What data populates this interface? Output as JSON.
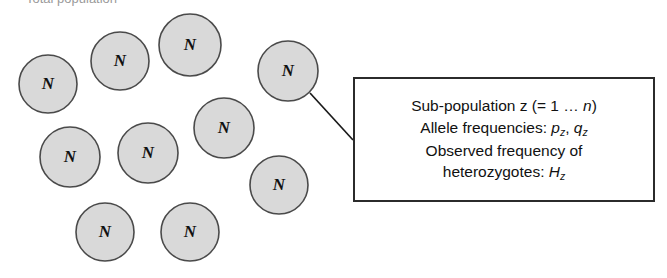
{
  "figure": {
    "title_clipped": "Total population",
    "background_color": "#ffffff",
    "circle_fill": "#d9d9d9",
    "circle_stroke": "#4a4a4a",
    "line_color": "#1a1a1a"
  },
  "demes": {
    "label": "N",
    "count": 10,
    "items": [
      {
        "label": "N",
        "cx": 48,
        "cy": 84,
        "r": 29
      },
      {
        "label": "N",
        "cx": 120,
        "cy": 61,
        "r": 29
      },
      {
        "label": "N",
        "cx": 190,
        "cy": 45,
        "r": 31
      },
      {
        "label": "N",
        "cx": 288,
        "cy": 71,
        "r": 30
      },
      {
        "label": "N",
        "cx": 224,
        "cy": 128,
        "r": 30
      },
      {
        "label": "N",
        "cx": 148,
        "cy": 153,
        "r": 30
      },
      {
        "label": "N",
        "cx": 70,
        "cy": 157,
        "r": 30
      },
      {
        "label": "N",
        "cx": 279,
        "cy": 185,
        "r": 29
      },
      {
        "label": "N",
        "cx": 105,
        "cy": 232,
        "r": 29
      },
      {
        "label": "N",
        "cx": 190,
        "cy": 232,
        "r": 29
      }
    ]
  },
  "leader": {
    "from_x": 310,
    "from_y": 93,
    "to_x": 353,
    "to_y": 140
  },
  "callout": {
    "line1_prefix": "Sub-population z (= 1 ",
    "line1_ellipsis": "… ",
    "line1_var": "n",
    "line1_suffix": ")",
    "line2_prefix": "Allele frequencies: ",
    "line2_var1": "p",
    "line2_sub1": "z",
    "line2_sep": ", ",
    "line2_var2": "q",
    "line2_sub2": "z",
    "line3": "Observed frequency of",
    "line4_prefix": "heterozygotes: ",
    "line4_var": "H",
    "line4_sub": "z"
  }
}
